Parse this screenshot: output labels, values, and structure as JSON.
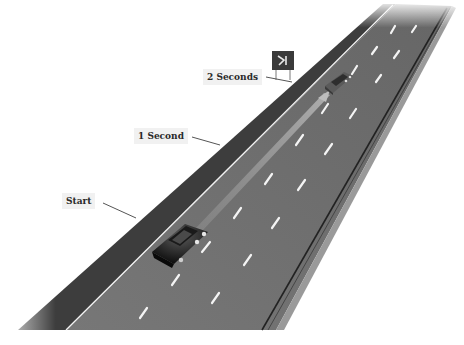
{
  "diagram": {
    "type": "following-distance-illustration",
    "labels": [
      {
        "id": "start",
        "text": "Start"
      },
      {
        "id": "one_second",
        "text": "1 Second"
      },
      {
        "id": "two_seconds",
        "text": "2 Seconds"
      }
    ],
    "objects": {
      "lead_car": "grey sedan ahead, passing roadside sign",
      "following_car": "black sedan at start marker",
      "roadside_sign": "fixed reference point sign",
      "trail": "path arrow from following car to lead car position"
    },
    "colors": {
      "background": "#ffffff",
      "shoulder": "#3f3f3f",
      "road": "#6e6e6e",
      "lane_marking": "#f4f4f4",
      "label_background": "#f1f1f1",
      "label_text": "#2a2a2a",
      "leader_line": "#555555"
    }
  }
}
